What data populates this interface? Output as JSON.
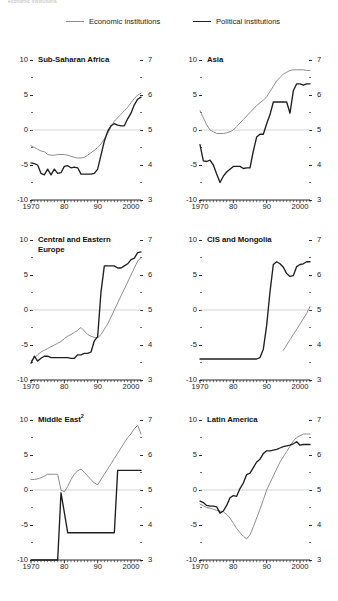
{
  "top_note": "economic institutions.",
  "legend": {
    "economic": {
      "label": "Economic institutions",
      "color": "#8e8e8e"
    },
    "political": {
      "label": "Political institutions",
      "color": "#1f1f1f"
    }
  },
  "axes": {
    "left_ticks": [
      "10",
      "5",
      "0",
      "-5",
      "-10"
    ],
    "right_ticks": [
      "7",
      "6",
      "5",
      "4",
      "3"
    ],
    "x_ticks": [
      "1970",
      "80",
      "90",
      "2000"
    ],
    "left_range": [
      -10,
      10
    ],
    "right_range": [
      3,
      7
    ],
    "x_range": [
      1970,
      2003
    ]
  },
  "chart_data": [
    {
      "type": "line",
      "title": "Sub-Saharan Africa",
      "footnote_marker": "",
      "xlabel": "",
      "ylabel": "",
      "xlim": [
        1970,
        2003
      ],
      "ylim": [
        -10,
        10
      ],
      "y2lim": [
        3,
        7
      ],
      "grid": false,
      "zero_line": true,
      "legend_position": "top",
      "series": [
        {
          "name": "Economic institutions",
          "axis": "right",
          "color": "#8e8e8e",
          "x": [
            1970,
            1971,
            1972,
            1973,
            1974,
            1975,
            1976,
            1977,
            1978,
            1979,
            1980,
            1981,
            1982,
            1983,
            1984,
            1985,
            1986,
            1987,
            1988,
            1989,
            1990,
            1991,
            1992,
            1993,
            1994,
            1995,
            1996,
            1997,
            1998,
            1999,
            2000,
            2001,
            2002,
            2003
          ],
          "values": [
            4.55,
            4.5,
            4.45,
            4.4,
            4.38,
            4.3,
            4.28,
            4.28,
            4.3,
            4.3,
            4.3,
            4.28,
            4.25,
            4.22,
            4.2,
            4.2,
            4.22,
            4.28,
            4.35,
            4.42,
            4.5,
            4.6,
            4.75,
            4.9,
            5.1,
            5.25,
            5.35,
            5.45,
            5.55,
            5.65,
            5.78,
            5.9,
            6.0,
            6.05
          ]
        },
        {
          "name": "Political institutions",
          "axis": "left",
          "color": "#1f1f1f",
          "x": [
            1970,
            1971,
            1972,
            1973,
            1974,
            1975,
            1976,
            1977,
            1978,
            1979,
            1980,
            1981,
            1982,
            1983,
            1984,
            1985,
            1986,
            1987,
            1988,
            1989,
            1990,
            1991,
            1992,
            1993,
            1994,
            1995,
            1996,
            1997,
            1998,
            1999,
            2000,
            2001,
            2002,
            2003
          ],
          "values": [
            -4.7,
            -4.8,
            -5.0,
            -6.2,
            -6.4,
            -5.6,
            -6.4,
            -5.6,
            -6.2,
            -6.1,
            -5.2,
            -5.1,
            -5.4,
            -5.3,
            -5.4,
            -6.3,
            -6.3,
            -6.3,
            -6.3,
            -6.2,
            -5.6,
            -3.6,
            -1.6,
            -0.2,
            0.6,
            0.9,
            0.7,
            0.6,
            0.6,
            1.6,
            2.4,
            3.6,
            4.4,
            4.7
          ]
        }
      ]
    },
    {
      "type": "line",
      "title": "Asia",
      "footnote_marker": "",
      "xlabel": "",
      "ylabel": "",
      "xlim": [
        1970,
        2003
      ],
      "ylim": [
        -10,
        10
      ],
      "y2lim": [
        3,
        7
      ],
      "grid": false,
      "zero_line": true,
      "legend_position": "top",
      "series": [
        {
          "name": "Economic institutions",
          "axis": "right",
          "color": "#8e8e8e",
          "x": [
            1970,
            1971,
            1972,
            1973,
            1974,
            1975,
            1976,
            1977,
            1978,
            1979,
            1980,
            1981,
            1982,
            1983,
            1984,
            1985,
            1986,
            1987,
            1988,
            1989,
            1990,
            1991,
            1992,
            1993,
            1994,
            1995,
            1996,
            1997,
            1998,
            1999,
            2000,
            2001,
            2002,
            2003
          ],
          "values": [
            5.55,
            5.35,
            5.15,
            5.0,
            4.95,
            4.9,
            4.9,
            4.9,
            4.92,
            4.95,
            5.0,
            5.1,
            5.2,
            5.3,
            5.4,
            5.5,
            5.6,
            5.7,
            5.78,
            5.85,
            5.95,
            6.1,
            6.25,
            6.4,
            6.5,
            6.6,
            6.65,
            6.7,
            6.72,
            6.72,
            6.72,
            6.72,
            6.7,
            6.7
          ]
        },
        {
          "name": "Political institutions",
          "axis": "left",
          "color": "#1f1f1f",
          "x": [
            1970,
            1971,
            1972,
            1973,
            1974,
            1975,
            1976,
            1977,
            1978,
            1979,
            1980,
            1981,
            1982,
            1983,
            1984,
            1985,
            1986,
            1987,
            1988,
            1989,
            1990,
            1991,
            1992,
            1993,
            1994,
            1995,
            1996,
            1997,
            1998,
            1999,
            2000,
            2001,
            2002,
            2003
          ],
          "values": [
            -2.1,
            -4.4,
            -4.5,
            -4.3,
            -5.0,
            -6.3,
            -7.5,
            -6.6,
            -6.0,
            -5.6,
            -5.2,
            -5.2,
            -5.2,
            -5.5,
            -5.4,
            -5.4,
            -3.0,
            -1.0,
            -0.6,
            -0.6,
            0.9,
            2.2,
            4.0,
            4.0,
            4.0,
            4.0,
            4.0,
            2.4,
            5.6,
            6.6,
            6.6,
            6.4,
            6.6,
            6.6
          ]
        }
      ]
    },
    {
      "type": "line",
      "title": "Central and Eastern\nEurope",
      "footnote_marker": "",
      "xlabel": "",
      "ylabel": "",
      "xlim": [
        1970,
        2003
      ],
      "ylim": [
        -10,
        10
      ],
      "y2lim": [
        3,
        7
      ],
      "grid": false,
      "zero_line": true,
      "legend_position": "top",
      "series": [
        {
          "name": "Economic institutions",
          "axis": "right",
          "color": "#8e8e8e",
          "x": [
            1970,
            1971,
            1972,
            1973,
            1974,
            1975,
            1976,
            1977,
            1978,
            1979,
            1980,
            1981,
            1982,
            1983,
            1984,
            1985,
            1986,
            1987,
            1988,
            1989,
            1990,
            1991,
            1992,
            1993,
            1994,
            1995,
            1996,
            1997,
            1998,
            1999,
            2000,
            2001,
            2002,
            2003
          ],
          "values": [
            3.55,
            3.62,
            3.72,
            3.8,
            3.85,
            3.9,
            3.95,
            4.0,
            4.05,
            4.1,
            4.18,
            4.25,
            4.3,
            4.36,
            4.42,
            4.5,
            4.4,
            4.3,
            4.25,
            4.22,
            4.2,
            4.3,
            4.45,
            4.6,
            4.8,
            5.0,
            5.2,
            5.4,
            5.6,
            5.8,
            6.0,
            6.2,
            6.4,
            6.5
          ]
        },
        {
          "name": "Political institutions",
          "axis": "left",
          "color": "#1f1f1f",
          "x": [
            1970,
            1971,
            1972,
            1973,
            1974,
            1975,
            1976,
            1977,
            1978,
            1979,
            1980,
            1981,
            1982,
            1983,
            1984,
            1985,
            1986,
            1987,
            1988,
            1989,
            1990,
            1991,
            1992,
            1993,
            1994,
            1995,
            1996,
            1997,
            1998,
            1999,
            2000,
            2001,
            2002,
            2003
          ],
          "values": [
            -7.6,
            -6.6,
            -7.3,
            -6.9,
            -6.6,
            -6.6,
            -6.8,
            -6.8,
            -6.8,
            -6.8,
            -6.8,
            -6.8,
            -6.9,
            -6.9,
            -6.4,
            -6.4,
            -6.2,
            -6.2,
            -6.0,
            -4.4,
            -3.8,
            2.6,
            6.3,
            6.3,
            6.3,
            6.3,
            6.0,
            6.0,
            6.3,
            6.6,
            7.2,
            7.4,
            8.2,
            8.3
          ]
        }
      ]
    },
    {
      "type": "line",
      "title": "CIS and Mongolia",
      "footnote_marker": "",
      "xlabel": "",
      "ylabel": "",
      "xlim": [
        1970,
        2003
      ],
      "ylim": [
        -10,
        10
      ],
      "y2lim": [
        3,
        7
      ],
      "grid": false,
      "zero_line": true,
      "legend_position": "top",
      "series": [
        {
          "name": "Economic institutions",
          "axis": "right",
          "color": "#8e8e8e",
          "x": [
            1995,
            1996,
            1997,
            1998,
            1999,
            2000,
            2001,
            2002,
            2003
          ],
          "values": [
            3.85,
            4.0,
            4.15,
            4.3,
            4.45,
            4.6,
            4.75,
            4.9,
            5.1
          ]
        },
        {
          "name": "Political institutions",
          "axis": "left",
          "color": "#1f1f1f",
          "x": [
            1970,
            1971,
            1972,
            1973,
            1974,
            1975,
            1976,
            1977,
            1978,
            1979,
            1980,
            1981,
            1982,
            1983,
            1984,
            1985,
            1986,
            1987,
            1988,
            1989,
            1990,
            1991,
            1992,
            1993,
            1994,
            1995,
            1996,
            1997,
            1998,
            1999,
            2000,
            2001,
            2002,
            2003
          ],
          "values": [
            -7.0,
            -7.0,
            -7.0,
            -7.0,
            -7.0,
            -7.0,
            -7.0,
            -7.0,
            -7.0,
            -7.0,
            -7.0,
            -7.0,
            -7.0,
            -7.0,
            -7.0,
            -7.0,
            -7.0,
            -7.0,
            -6.8,
            -5.6,
            -2.2,
            2.6,
            6.5,
            6.9,
            6.6,
            6.1,
            5.2,
            4.8,
            4.9,
            6.2,
            6.5,
            6.6,
            6.9,
            6.9
          ]
        }
      ]
    },
    {
      "type": "line",
      "title": "Middle East",
      "footnote_marker": "2",
      "xlabel": "",
      "ylabel": "",
      "xlim": [
        1970,
        2003
      ],
      "ylim": [
        -10,
        10
      ],
      "y2lim": [
        3,
        7
      ],
      "grid": false,
      "zero_line": true,
      "legend_position": "top",
      "series": [
        {
          "name": "Economic institutions",
          "axis": "right",
          "color": "#8e8e8e",
          "x": [
            1970,
            1971,
            1972,
            1973,
            1974,
            1975,
            1976,
            1977,
            1978,
            1979,
            1980,
            1981,
            1982,
            1983,
            1984,
            1985,
            1986,
            1987,
            1988,
            1989,
            1990,
            1991,
            1992,
            1993,
            1994,
            1995,
            1996,
            1997,
            1998,
            1999,
            2000,
            2001,
            2002,
            2003
          ],
          "values": [
            5.3,
            5.3,
            5.32,
            5.35,
            5.4,
            5.45,
            5.45,
            5.45,
            5.45,
            5.0,
            4.95,
            5.1,
            5.3,
            5.45,
            5.55,
            5.6,
            5.5,
            5.4,
            5.3,
            5.2,
            5.15,
            5.3,
            5.45,
            5.6,
            5.75,
            5.9,
            6.05,
            6.2,
            6.35,
            6.5,
            6.6,
            6.75,
            6.85,
            6.6
          ]
        },
        {
          "name": "Political institutions",
          "axis": "left",
          "color": "#1f1f1f",
          "x": [
            1970,
            1971,
            1972,
            1973,
            1974,
            1975,
            1976,
            1977,
            1978,
            1979,
            1980,
            1981,
            1982,
            1983,
            1984,
            1985,
            1986,
            1987,
            1988,
            1989,
            1990,
            1991,
            1992,
            1993,
            1994,
            1995,
            1996,
            1997,
            1998,
            1999,
            2000,
            2001,
            2002,
            2003
          ],
          "values": [
            -10.0,
            -10.0,
            -10.0,
            -10.0,
            -10.0,
            -10.0,
            -10.0,
            -10.0,
            -10.0,
            -0.4,
            -3.2,
            -6.1,
            -6.1,
            -6.1,
            -6.1,
            -6.1,
            -6.1,
            -6.1,
            -6.1,
            -6.1,
            -6.1,
            -6.1,
            -6.1,
            -6.1,
            -6.1,
            -6.1,
            2.8,
            2.8,
            2.8,
            2.8,
            2.8,
            2.8,
            2.8,
            2.8
          ]
        }
      ]
    },
    {
      "type": "line",
      "title": "Latin America",
      "footnote_marker": "",
      "xlabel": "",
      "ylabel": "",
      "xlim": [
        1970,
        2003
      ],
      "ylim": [
        -10,
        10
      ],
      "y2lim": [
        3,
        7
      ],
      "grid": false,
      "zero_line": true,
      "legend_position": "top",
      "series": [
        {
          "name": "Economic institutions",
          "axis": "right",
          "color": "#8e8e8e",
          "x": [
            1970,
            1971,
            1972,
            1973,
            1974,
            1975,
            1976,
            1977,
            1978,
            1979,
            1980,
            1981,
            1982,
            1983,
            1984,
            1985,
            1986,
            1987,
            1988,
            1989,
            1990,
            1991,
            1992,
            1993,
            1994,
            1995,
            1996,
            1997,
            1998,
            1999,
            2000,
            2001,
            2002,
            2003
          ],
          "values": [
            4.6,
            4.55,
            4.5,
            4.48,
            4.45,
            4.42,
            4.4,
            4.38,
            4.3,
            4.2,
            4.05,
            3.9,
            3.78,
            3.68,
            3.6,
            3.72,
            3.95,
            4.2,
            4.45,
            4.72,
            5.0,
            5.2,
            5.4,
            5.6,
            5.8,
            5.95,
            6.1,
            6.25,
            6.4,
            6.5,
            6.55,
            6.6,
            6.6,
            6.6
          ]
        },
        {
          "name": "Political institutions",
          "axis": "left",
          "color": "#1f1f1f",
          "x": [
            1970,
            1971,
            1972,
            1973,
            1974,
            1975,
            1976,
            1977,
            1978,
            1979,
            1980,
            1981,
            1982,
            1983,
            1984,
            1985,
            1986,
            1987,
            1988,
            1989,
            1990,
            1991,
            1992,
            1993,
            1994,
            1995,
            1996,
            1997,
            1998,
            1999,
            2000,
            2001,
            2002,
            2003
          ],
          "values": [
            -1.6,
            -1.8,
            -2.2,
            -2.3,
            -2.3,
            -2.4,
            -3.3,
            -3.0,
            -2.2,
            -1.1,
            -0.8,
            -0.9,
            0.2,
            1.0,
            2.2,
            2.4,
            3.2,
            4.0,
            4.4,
            5.2,
            5.6,
            5.6,
            5.7,
            5.8,
            6.0,
            6.2,
            6.3,
            6.4,
            6.6,
            6.9,
            6.4,
            6.5,
            6.5,
            6.5
          ]
        }
      ]
    }
  ]
}
